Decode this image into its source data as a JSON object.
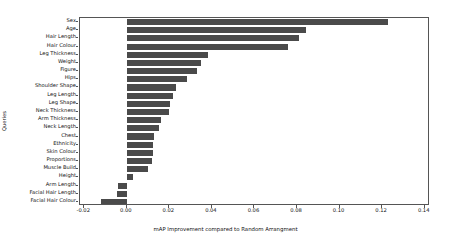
{
  "chart_data": {
    "type": "bar",
    "orientation": "horizontal",
    "title": "",
    "xlabel": "mAP Improvement compared to Random Arrangment",
    "ylabel": "Queries",
    "xlim": [
      -0.022,
      0.1425
    ],
    "grid": false,
    "legend": null,
    "xticks": [
      "-0.02",
      "0.00",
      "0.02",
      "0.04",
      "0.06",
      "0.08",
      "0.10",
      "0.12",
      "0.14"
    ],
    "xtick_values": [
      -0.02,
      0.0,
      0.02,
      0.04,
      0.06,
      0.08,
      0.1,
      0.12,
      0.14
    ],
    "bar_color": "#4a4a4a",
    "categories": [
      "Sex",
      "Age",
      "Hair Length",
      "Hair Colour",
      "Leg Thickness",
      "Weight",
      "Figure",
      "Hips",
      "Shoulder Shape",
      "Leg Length",
      "Leg Shape",
      "Neck Thickness",
      "Arm Thickness",
      "Neck Length",
      "Chest",
      "Ethnicity",
      "Skin Colour",
      "Proportions",
      "Muscle Build",
      "Height",
      "Arm Length",
      "Facial Hair Length",
      "Facial Hair Colour"
    ],
    "values": [
      0.123,
      0.084,
      0.0808,
      0.076,
      0.038,
      0.035,
      0.033,
      0.0285,
      0.023,
      0.0215,
      0.0205,
      0.02,
      0.016,
      0.015,
      0.013,
      0.0125,
      0.0125,
      0.012,
      0.01,
      0.003,
      -0.0042,
      -0.0048,
      -0.0123
    ]
  }
}
